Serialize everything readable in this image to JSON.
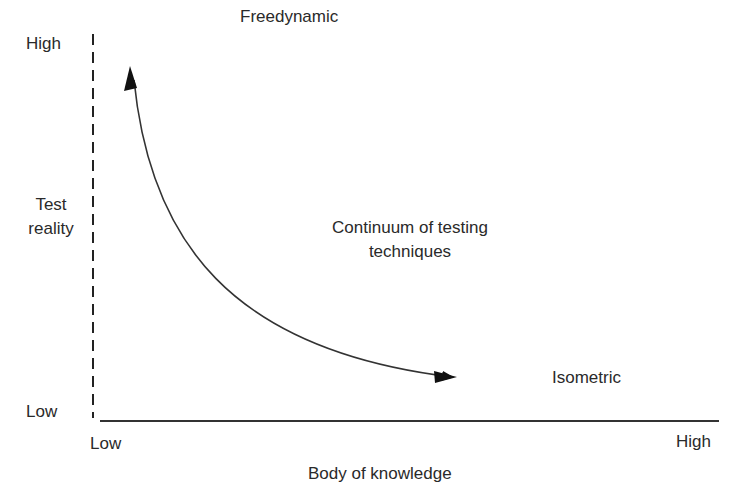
{
  "y_axis": {
    "title_line1": "Test",
    "title_line2": "reality",
    "high_label": "High",
    "low_label": "Low",
    "style": "dashed"
  },
  "x_axis": {
    "title": "Body of knowledge",
    "low_label": "Low",
    "high_label": "High",
    "style": "solid"
  },
  "annotations": {
    "top": "Freedynamic",
    "middle_line1": "Continuum of testing",
    "middle_line2": "techniques",
    "bottom_right": "Isometric"
  },
  "curve": {
    "description": "double-headed curved arrow from high test reality/low knowledge to low test reality/high knowledge",
    "stroke_color": "#333333"
  },
  "colors": {
    "background": "#ffffff",
    "ink": "#222222"
  }
}
